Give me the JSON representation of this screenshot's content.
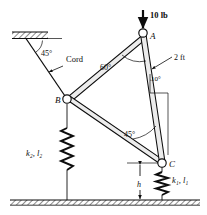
{
  "figure": {
    "joints": [
      {
        "id": "A",
        "label": "A",
        "x": 143,
        "y": 33
      },
      {
        "id": "B",
        "label": "B",
        "x": 67,
        "y": 99
      },
      {
        "id": "C",
        "label": "C",
        "x": 162,
        "y": 163
      }
    ],
    "load": {
      "label": "10 lb",
      "arrow_x": 143,
      "arrow_top": 10,
      "arrow_bottom": 30
    },
    "cord": {
      "label": "Cord",
      "anchor_x": 26,
      "anchor_y": 36
    },
    "angles": [
      {
        "label": "45°",
        "at": "wall",
        "x": 47,
        "y": 51
      },
      {
        "label": "60°",
        "at": "A",
        "x": 107,
        "y": 66
      },
      {
        "label": "10°",
        "at": "AC",
        "x": 153,
        "y": 85
      },
      {
        "label": "45°",
        "at": "C",
        "x": 131,
        "y": 134
      }
    ],
    "dimensions": [
      {
        "label": "2 ft",
        "x": 176,
        "y": 62
      },
      {
        "label": "h",
        "x": 140,
        "y": 186
      }
    ],
    "springs": [
      {
        "id": "k2",
        "label": "k₂, l₂",
        "x": 36,
        "y": 153,
        "side": "left"
      },
      {
        "id": "k1",
        "label": "k₁, l₁",
        "x": 176,
        "y": 180,
        "side": "right"
      }
    ],
    "ground": {
      "name": "ground-hatch",
      "y": 200
    },
    "wall": {
      "name": "wall-hatch",
      "x": 12,
      "y": 32,
      "width": 36,
      "height": 7
    },
    "colors": {
      "ink": "#0d0d0d",
      "member_fill": "#e8e8e8",
      "hatch": "#8a8a8a",
      "background": "#ffffff"
    }
  }
}
